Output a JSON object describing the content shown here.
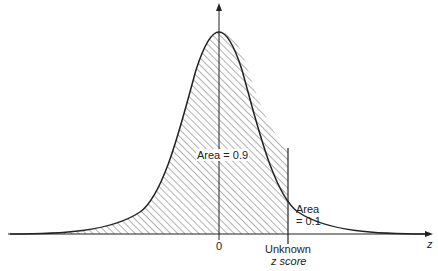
{
  "figure": {
    "type": "normal-distribution-diagram",
    "curve": "standard normal density",
    "shaded_region": "left of unknown z score (hatched)",
    "labels": {
      "left_area": "Area = 0.9",
      "right_area_line1": "Area",
      "right_area_line2": "= 0.1",
      "origin_tick": "0",
      "cutoff_line1": "Unknown",
      "cutoff_line2": "z score",
      "axis": "z"
    },
    "colors": {
      "line": "#222222",
      "hatch": "#555555",
      "background": "#ffffff"
    }
  }
}
